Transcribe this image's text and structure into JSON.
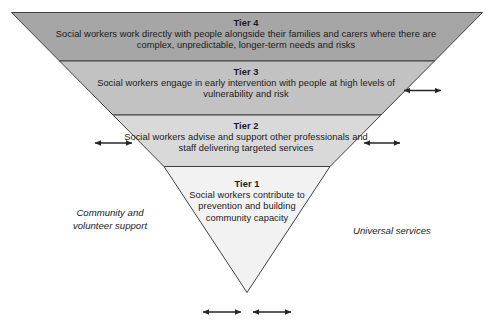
{
  "diagram": {
    "shape": "inverted-pyramid",
    "colors": {
      "tier4_fill": "#a6a6a6",
      "tier3_fill": "#c2c2c2",
      "tier2_fill": "#d9d9d9",
      "tier1_fill": "#f2f2f2",
      "outline": "#404040",
      "text": "#1a1a1a",
      "arrow": "#262626",
      "background": "#ffffff"
    }
  },
  "tiers": [
    {
      "id": "tier4",
      "title": "Tier 4",
      "body": "Social workers work directly with people alongside their families and carers where there are complex, unpredictable, longer-term needs and risks"
    },
    {
      "id": "tier3",
      "title": "Tier 3",
      "body": "Social workers engage in early intervention with people at high levels of vulnerability and risk"
    },
    {
      "id": "tier2",
      "title": "Tier 2",
      "body": "Social workers advise and support other professionals and staff delivering targeted services"
    },
    {
      "id": "tier1",
      "title": "Tier 1",
      "body": "Social workers contribute to prevention and building community capacity"
    }
  ],
  "side_labels": {
    "left": "Community and volunteer support",
    "right": "Universal services"
  },
  "arrows": [
    {
      "name": "tier3-right-arrow",
      "orientation": "horizontal",
      "double_headed": true
    },
    {
      "name": "tier2-left-arrow",
      "orientation": "horizontal",
      "double_headed": true
    },
    {
      "name": "tier2-right-arrow",
      "orientation": "horizontal",
      "double_headed": true
    },
    {
      "name": "apex-left-arrow",
      "orientation": "horizontal",
      "double_headed": true
    },
    {
      "name": "apex-right-arrow",
      "orientation": "horizontal",
      "double_headed": true
    }
  ]
}
